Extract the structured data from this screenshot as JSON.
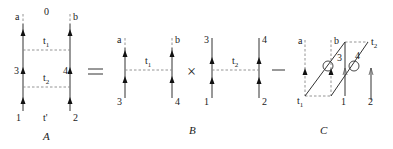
{
  "diagram": {
    "panels": [
      {
        "id": "A",
        "caption": "A",
        "labels": {
          "top_left": "a",
          "top_middle": "0",
          "top_right": "b",
          "upper_rung": "t1",
          "mid_left": "3",
          "mid_right": "4",
          "lower_rung": "t2",
          "bottom_left": "1",
          "bottom_middle": "t'",
          "bottom_right": "2"
        }
      },
      {
        "id": "B",
        "caption": "B",
        "factors": [
          {
            "top_left": "a",
            "top_right": "b",
            "rung": "t1",
            "bottom_left": "3",
            "bottom_right": "4"
          },
          {
            "top_left": "3",
            "top_right": "4",
            "rung": "t2",
            "bottom_left": "1",
            "bottom_right": "2"
          }
        ]
      },
      {
        "id": "C",
        "caption": "C",
        "labels": {
          "top_left": "a",
          "top_mid": "b",
          "top_right_corner": "t2",
          "bottom_left_corner": "t1",
          "crossing_1": "3",
          "crossing_2": "4",
          "bottom_1": "1",
          "bottom_2": "2"
        }
      }
    ],
    "operators": {
      "equals": "=",
      "times": "×",
      "minus": "—"
    },
    "subscripts": {
      "t1_base": "t",
      "t1_sub": "1",
      "t2_base": "t",
      "t2_sub": "2"
    }
  }
}
